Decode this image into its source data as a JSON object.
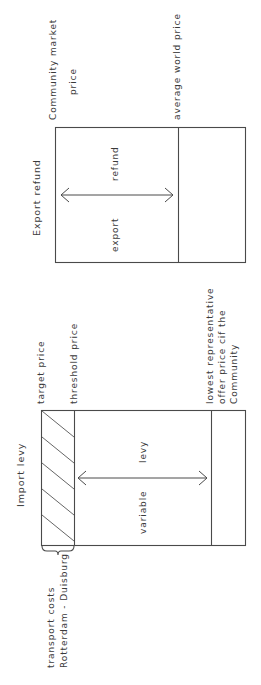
{
  "export_refund": {
    "title": "Export refund",
    "labels": {
      "community_market_price_line1": "Community market",
      "community_market_price_line2": "price",
      "average_world_price": "average world price"
    },
    "box_text": {
      "refund": "refund",
      "export": "export"
    }
  },
  "import_levy": {
    "title": "Import levy",
    "labels": {
      "target_price": "target price",
      "threshold_price": "threshold price",
      "lowest_offer_line1": "lowest representative",
      "lowest_offer_line2": "offer price cif the",
      "lowest_offer_line3": "Community",
      "transport_costs_line1": "transport  costs",
      "transport_costs_line2": "Rotterdam - Duisburg"
    },
    "box_text": {
      "levy": "levy",
      "variable": "variable"
    }
  },
  "colors": {
    "line": "#4a4a4a",
    "text": "#3a3a3a",
    "background": "#ffffff"
  }
}
